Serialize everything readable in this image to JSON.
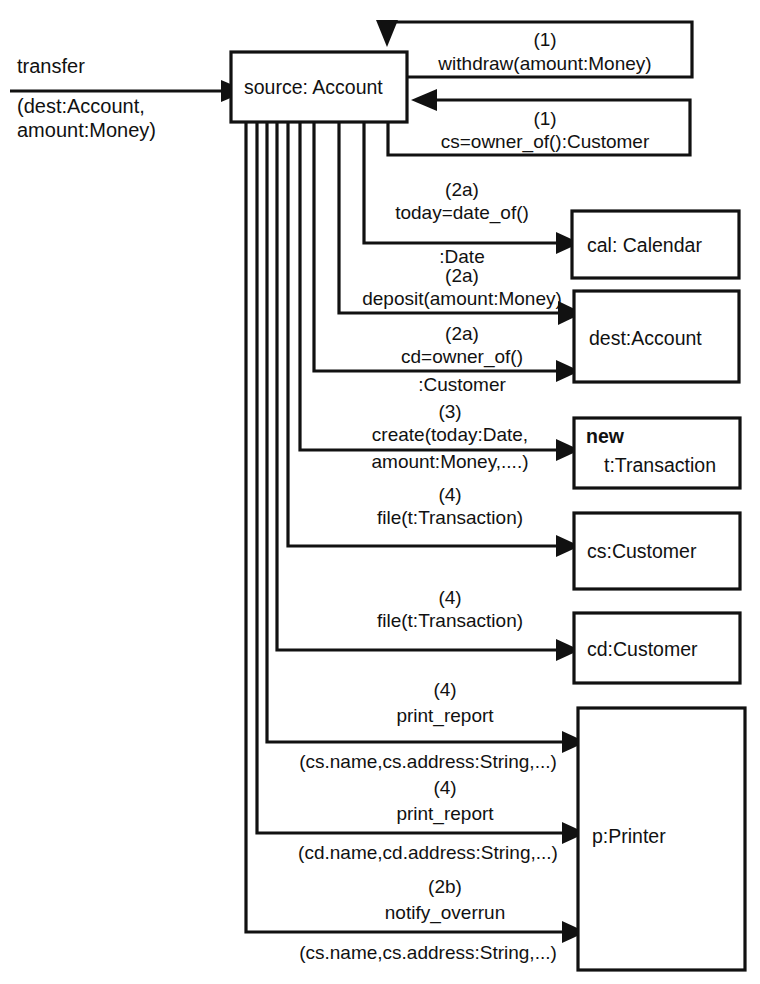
{
  "diagram": {
    "kind": "uml-collaboration-diagram",
    "stroke_color": "#111111",
    "fill_color": "#ffffff",
    "background": "#ffffff"
  },
  "objects": [
    {
      "id": "source",
      "label": "source: Account",
      "stereotype": ""
    },
    {
      "id": "cal",
      "label": "cal: Calendar",
      "stereotype": ""
    },
    {
      "id": "dest",
      "label": "dest:Account",
      "stereotype": ""
    },
    {
      "id": "transaction",
      "label": "t:Transaction",
      "stereotype": "new"
    },
    {
      "id": "cs",
      "label": "cs:Customer",
      "stereotype": ""
    },
    {
      "id": "cd",
      "label": "cd:Customer",
      "stereotype": ""
    },
    {
      "id": "printer",
      "label": "p:Printer",
      "stereotype": ""
    }
  ],
  "external_message": {
    "name": "transfer",
    "args_line1": "(dest:Account,",
    "args_line2": "amount:Money)",
    "target": "source"
  },
  "messages": [
    {
      "seq": "(1)",
      "name": "withdraw(amount:Money)",
      "from": "source",
      "to": "source",
      "kind": "self"
    },
    {
      "seq": "(1)",
      "name": "cs=owner_of():Customer",
      "from": "source",
      "to": "source",
      "kind": "self-return"
    },
    {
      "seq": "(2a)",
      "name": "today=date_of()",
      "name_line2": ":Date",
      "from": "source",
      "to": "cal",
      "kind": "call"
    },
    {
      "seq": "(2a)",
      "name": "deposit(amount:Money)",
      "name_line2": "",
      "from": "source",
      "to": "dest",
      "kind": "call"
    },
    {
      "seq": "(2a)",
      "name": "cd=owner_of()",
      "name_line2": ":Customer",
      "from": "source",
      "to": "dest",
      "kind": "call"
    },
    {
      "seq": "(3)",
      "name": "create(today:Date,",
      "name_line2": "amount:Money,....)",
      "from": "source",
      "to": "transaction",
      "kind": "create"
    },
    {
      "seq": "(4)",
      "name": "file(t:Transaction)",
      "name_line2": "",
      "from": "source",
      "to": "cs",
      "kind": "call"
    },
    {
      "seq": "(4)",
      "name": "file(t:Transaction)",
      "name_line2": "",
      "from": "source",
      "to": "cd",
      "kind": "call"
    },
    {
      "seq": "(4)",
      "name": "print_report",
      "name_line2": "(cs.name,cs.address:String,...)",
      "from": "source",
      "to": "printer",
      "kind": "call"
    },
    {
      "seq": "(4)",
      "name": "print_report",
      "name_line2": "(cd.name,cd.address:String,...)",
      "from": "source",
      "to": "printer",
      "kind": "call"
    },
    {
      "seq": "(2b)",
      "name": "notify_overrun",
      "name_line2": "(cs.name,cs.address:String,...)",
      "from": "source",
      "to": "printer",
      "kind": "call"
    }
  ]
}
